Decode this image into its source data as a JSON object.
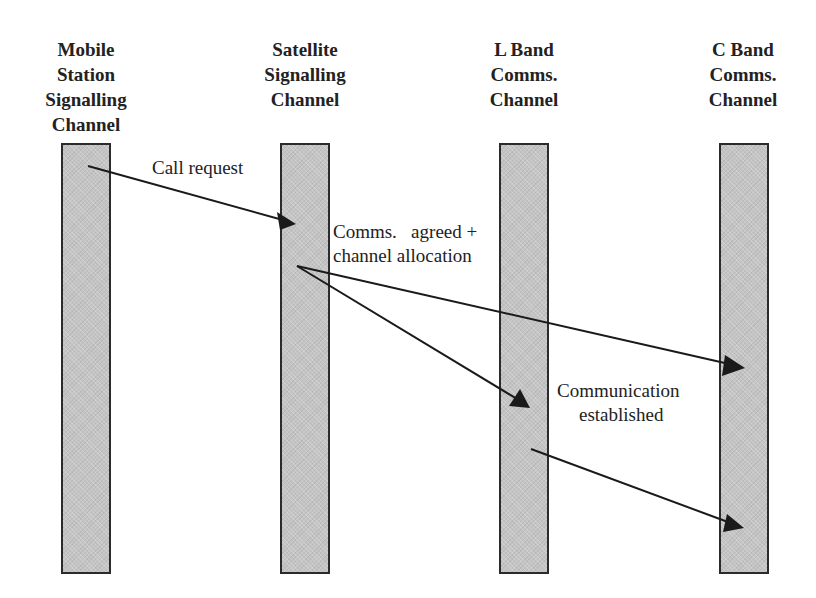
{
  "diagram": {
    "type": "sequence",
    "lanes": [
      {
        "id": "mobile",
        "title": "Mobile\nStation\nSignalling\nChannel"
      },
      {
        "id": "satellite",
        "title": "Satellite\nSignalling\nChannel"
      },
      {
        "id": "lband",
        "title": "L Band\nComms.\nChannel"
      },
      {
        "id": "cband",
        "title": "C Band\nComms.\nChannel"
      }
    ],
    "messages": [
      {
        "from": "mobile",
        "to": "satellite",
        "label": "Call request"
      },
      {
        "from": "satellite",
        "to": "cband",
        "label": "Comms.  agreed + channel allocation"
      },
      {
        "from": "satellite",
        "to": "lband",
        "label": "Comms.  agreed + channel allocation"
      },
      {
        "from": "lband",
        "to": "cband",
        "label": "Communication established"
      }
    ],
    "labels": {
      "call_request": "Call request",
      "comms_agreed_line1": "Comms.   agreed +",
      "comms_agreed_line2": "channel allocation",
      "comm_established_line1": "Communication",
      "comm_established_line2": "established"
    },
    "colors": {
      "bar_fill": "#c4c4c4",
      "bar_border": "#2b2b2b",
      "arrow": "#1a1a1a"
    }
  }
}
